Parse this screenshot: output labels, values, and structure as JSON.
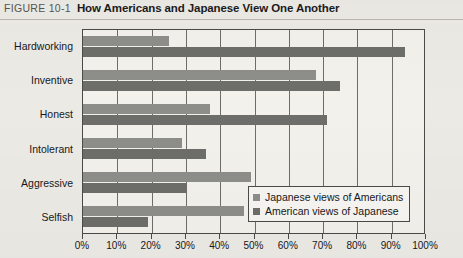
{
  "figure": {
    "number": "FIGURE 10-1",
    "title": "How Americans and Japanese View One Another"
  },
  "colors": {
    "series_light": "#8d8d8a",
    "series_dark": "#6d6d6a",
    "plot_border": "#4a4a48",
    "page_background": "#eceae5"
  },
  "chart_data": {
    "type": "bar",
    "orientation": "horizontal",
    "title": "How Americans and Japanese View One Another",
    "xlabel": "",
    "ylabel": "",
    "xlim": [
      0,
      100
    ],
    "xtick_labels": [
      "0%",
      "10%",
      "20%",
      "30%",
      "40%",
      "50%",
      "60%",
      "70%",
      "80%",
      "90%",
      "100%"
    ],
    "xtick_values": [
      0,
      10,
      20,
      30,
      40,
      50,
      60,
      70,
      80,
      90,
      100
    ],
    "grid": "vertical",
    "legend_position": "inside-bottom-right",
    "categories": [
      "Hardworking",
      "Inventive",
      "Honest",
      "Intolerant",
      "Aggressive",
      "Selfish"
    ],
    "series": [
      {
        "name": "Japanese views of Americans",
        "color": "#8d8d8a",
        "values": [
          25,
          68,
          37,
          29,
          49,
          47
        ]
      },
      {
        "name": "American views of Japanese",
        "color": "#6d6d6a",
        "values": [
          94,
          75,
          71,
          36,
          30,
          19
        ]
      }
    ]
  },
  "legend": {
    "items": [
      {
        "label": "Japanese views of Americans",
        "color": "#8d8d8a"
      },
      {
        "label": "American views of Japanese",
        "color": "#6d6d6a"
      }
    ]
  }
}
